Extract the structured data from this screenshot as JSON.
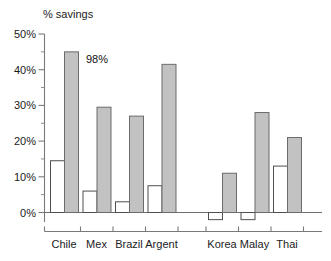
{
  "chart": {
    "axis_title": "% savings",
    "annotation": {
      "text": "98%",
      "attached_to": "Chile filled bar"
    }
  },
  "chart_data": {
    "type": "bar",
    "title": "",
    "subtitle": "",
    "xlabel": "",
    "ylabel": "% savings",
    "ylim": [
      -5,
      50
    ],
    "ytick_labels": [
      "0%",
      "10%",
      "20%",
      "30%",
      "40%",
      "50%"
    ],
    "ytick_values": [
      0,
      10,
      20,
      30,
      40,
      50
    ],
    "yminor_step": 5,
    "grid": false,
    "legend_position": "none",
    "group_gap_after": "Argent",
    "categories": [
      "Chile",
      "Mex",
      "Brazil",
      "Argent",
      "Korea",
      "Malay",
      "Thai"
    ],
    "series": [
      {
        "name": "open",
        "style": "white-bar",
        "values": [
          14.5,
          6.0,
          3.0,
          7.5,
          -2.0,
          -2.0,
          13.0
        ]
      },
      {
        "name": "filled",
        "style": "gray-bar",
        "values": [
          45.0,
          29.5,
          27.0,
          41.5,
          11.0,
          28.0,
          21.0
        ]
      }
    ],
    "annotations": [
      {
        "text": "98%",
        "x": "Chile",
        "y": 45.0
      }
    ],
    "colors": {
      "open_fill": "#ffffff",
      "open_stroke": "#4f4f4f",
      "filled_fill": "#c2c2c2",
      "filled_stroke": "#6b6b6b",
      "axis": "#7a7a7a",
      "text": "#1a1a1a"
    }
  }
}
